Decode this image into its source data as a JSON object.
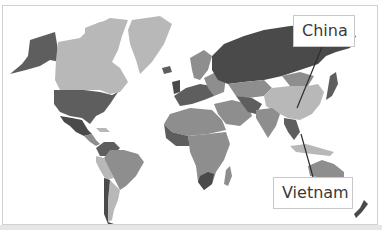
{
  "map": {
    "type": "choropleth-world-map",
    "color_scheme": "grayscale",
    "colors": {
      "frame_border": "#d0d0d0",
      "ocean": "#ffffff",
      "light_gray": "#b8b8b8",
      "mid_gray": "#8e8e8e",
      "dark_gray": "#5e5e5e",
      "darkest_gray": "#4a4a4a",
      "leader_line": "#2e2e2e"
    },
    "labels": [
      {
        "id": "china",
        "text": "China"
      },
      {
        "id": "vietnam",
        "text": "Vietnam"
      }
    ]
  }
}
